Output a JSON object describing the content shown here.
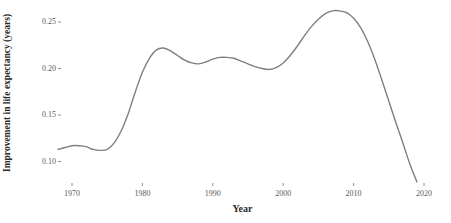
{
  "chart_data": {
    "type": "line",
    "title": "",
    "subtitle": "",
    "xlabel": "Year",
    "ylabel": "Improvement in life expectancy (years)",
    "xlim": [
      1967.5,
      2020.5
    ],
    "ylim": [
      0.072,
      0.268
    ],
    "grid": false,
    "legend": null,
    "line_color": "#7f7f7f",
    "line_width": 1.4,
    "background": "#ffffff",
    "xticks": [
      1970,
      1980,
      1990,
      2000,
      2010,
      2020
    ],
    "xtick_labels": [
      "1970",
      "1980",
      "1990",
      "2000",
      "2010",
      "2020"
    ],
    "yticks": [
      0.1,
      0.15,
      0.2,
      0.25
    ],
    "ytick_labels": [
      "0.10",
      "0.15",
      "0.20",
      "0.25"
    ],
    "series": [
      {
        "name": "Improvement in life expectancy",
        "x": [
          1968,
          1969,
          1970,
          1971,
          1972,
          1973,
          1974,
          1975,
          1976,
          1977,
          1978,
          1979,
          1980,
          1981,
          1982,
          1983,
          1984,
          1985,
          1986,
          1987,
          1988,
          1989,
          1990,
          1991,
          1992,
          1993,
          1994,
          1995,
          1996,
          1997,
          1998,
          1999,
          2000,
          2001,
          2002,
          2003,
          2004,
          2005,
          2006,
          2007,
          2008,
          2009,
          2010,
          2011,
          2012,
          2013,
          2014,
          2015,
          2016,
          2017,
          2018,
          2019
        ],
        "values": [
          0.113,
          0.115,
          0.117,
          0.117,
          0.116,
          0.113,
          0.112,
          0.113,
          0.12,
          0.133,
          0.152,
          0.175,
          0.196,
          0.211,
          0.22,
          0.222,
          0.219,
          0.214,
          0.209,
          0.206,
          0.205,
          0.207,
          0.21,
          0.212,
          0.212,
          0.211,
          0.208,
          0.205,
          0.202,
          0.2,
          0.199,
          0.201,
          0.206,
          0.214,
          0.224,
          0.235,
          0.245,
          0.253,
          0.259,
          0.262,
          0.262,
          0.26,
          0.254,
          0.244,
          0.229,
          0.21,
          0.188,
          0.165,
          0.142,
          0.12,
          0.097,
          0.078
        ]
      }
    ]
  },
  "axis": {
    "y_title": "Improvement in life expectancy (years)",
    "x_title": "Year"
  }
}
